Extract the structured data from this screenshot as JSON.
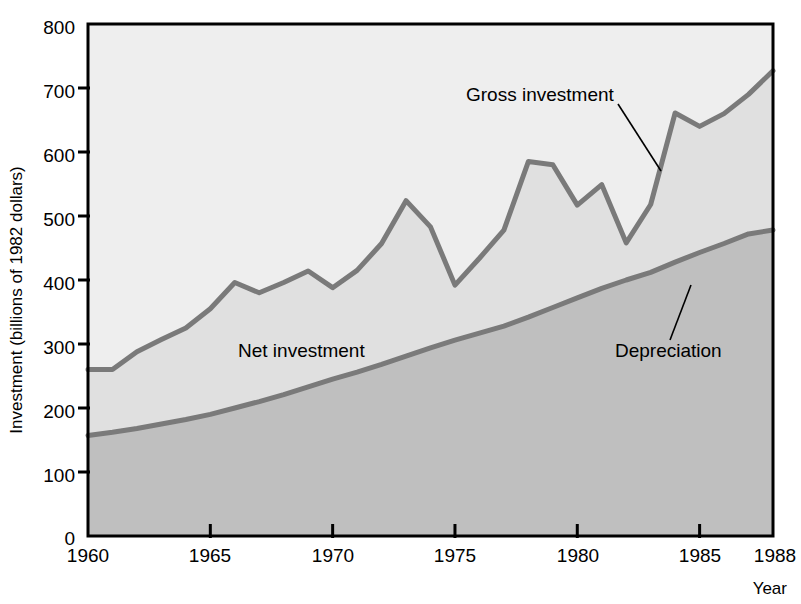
{
  "figure": {
    "background_color": "#ffffff",
    "plot_border_color": "#000000"
  },
  "axes": {
    "y_axis_title": "Investment (billions of 1982 dollars)",
    "x_axis_title": "Year",
    "y_tick_labels": [
      "800",
      "700",
      "600",
      "500",
      "400",
      "300",
      "200",
      "100",
      "0"
    ],
    "x_tick_labels": [
      "1960",
      "1965",
      "1970",
      "1975",
      "1980",
      "1985",
      "1988"
    ]
  },
  "annotations": {
    "gross_investment_label": "Gross investment",
    "net_investment_label": "Net investment",
    "depreciation_label": "Depreciation"
  },
  "colors": {
    "gross_band_fill": "#eeeeee",
    "net_band_fill": "#e0e0e0",
    "depreciation_fill": "#bfbfbf",
    "line_color": "#7a7a7a",
    "axis_color": "#000000"
  },
  "chart_data": {
    "type": "area",
    "title": "",
    "subtitle": "",
    "xlabel": "Year",
    "ylabel": "Investment (billions of 1982 dollars)",
    "xlim": [
      1960,
      1988
    ],
    "ylim": [
      0,
      800
    ],
    "ytick_values": [
      0,
      100,
      200,
      300,
      400,
      500,
      600,
      700,
      800
    ],
    "xtick_values": [
      1960,
      1965,
      1970,
      1975,
      1980,
      1985,
      1988
    ],
    "grid": false,
    "legend_position": "inline-annotations",
    "x": [
      1960,
      1961,
      1962,
      1963,
      1964,
      1965,
      1966,
      1967,
      1968,
      1969,
      1970,
      1971,
      1972,
      1973,
      1974,
      1975,
      1976,
      1977,
      1978,
      1979,
      1980,
      1981,
      1982,
      1983,
      1984,
      1985,
      1986,
      1987,
      1988
    ],
    "series": [
      {
        "name": "Gross investment",
        "values": [
          260,
          260,
          288,
          307,
          325,
          355,
          396,
          380,
          396,
          414,
          388,
          415,
          457,
          524,
          483,
          392,
          434,
          478,
          585,
          580,
          517,
          549,
          458,
          518,
          661,
          640,
          660,
          690,
          727
        ]
      },
      {
        "name": "Depreciation",
        "values": [
          157,
          162,
          168,
          175,
          182,
          190,
          200,
          210,
          221,
          233,
          245,
          256,
          268,
          281,
          294,
          306,
          317,
          328,
          342,
          357,
          372,
          387,
          400,
          412,
          428,
          443,
          457,
          472,
          478
        ]
      }
    ],
    "annotations": [
      {
        "text": "Gross investment",
        "points_to_year": 1983
      },
      {
        "text": "Net investment",
        "region": "band between gross investment and depreciation"
      },
      {
        "text": "Depreciation",
        "points_to_year": 1981
      }
    ]
  }
}
